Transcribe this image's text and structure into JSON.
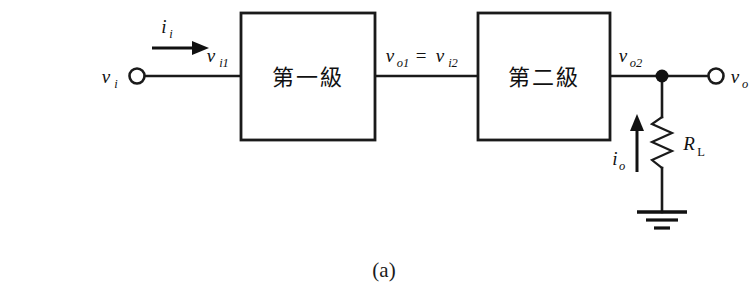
{
  "figure": {
    "caption": "(a)",
    "type": "two-stage amplifier block diagram",
    "background_color": "#ffffff",
    "line_color": "#111111"
  },
  "blocks": [
    {
      "id": "stage1",
      "label": "第一級"
    },
    {
      "id": "stage2",
      "label": "第二級"
    }
  ],
  "labels": {
    "input_voltage": {
      "base": "v",
      "sub": "i"
    },
    "input_current": {
      "base": "i",
      "sub": "i"
    },
    "stage1_input": {
      "base": "v",
      "sub": "i1"
    },
    "interstage": {
      "base_left": "v",
      "sub_left": "o1",
      "equals": "=",
      "base_right": "v",
      "sub_right": "i2"
    },
    "stage2_output": {
      "base": "v",
      "sub": "o2"
    },
    "output_voltage": {
      "base": "v",
      "sub": "o"
    },
    "output_current": {
      "base": "i",
      "sub": "o"
    },
    "load_resistor": {
      "base": "R",
      "sub": "L"
    }
  },
  "components": {
    "input_terminal": "open-circle-terminal",
    "output_terminal": "open-circle-terminal",
    "junction": "node-dot",
    "resistor": "zigzag-resistor",
    "ground": "ground-symbol",
    "current_arrow_in": "arrow-right",
    "current_arrow_out": "arrow-up"
  }
}
